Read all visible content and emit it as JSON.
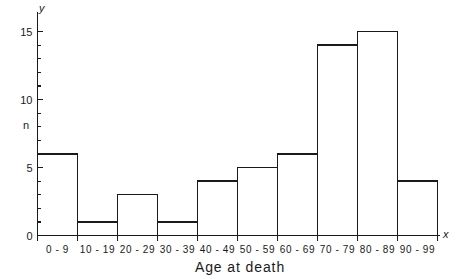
{
  "chart_data": {
    "type": "bar",
    "title": "",
    "subtitle": "",
    "xlabel": "Age at death",
    "ylabel": "n",
    "x_axis_name": "x",
    "y_axis_name": "y",
    "categories": [
      "0-9",
      "10-19",
      "20-29",
      "30-39",
      "40-49",
      "50-59",
      "60-69",
      "70-79",
      "80-89",
      "90-99"
    ],
    "values": [
      6,
      1,
      3,
      1,
      4,
      5,
      6,
      14,
      15,
      4
    ],
    "ylim": [
      0,
      16
    ],
    "y_major_ticks": [
      0,
      5,
      10,
      15
    ],
    "y_major_tick_labels": [
      "0",
      "5",
      "10",
      "15"
    ],
    "y_minor_tick_step": 1,
    "grid": false,
    "legend": null,
    "bar_style": "outline",
    "colors": {
      "stroke": "#1a1a1a",
      "fill": "#ffffff",
      "background": "#ffffff"
    }
  }
}
